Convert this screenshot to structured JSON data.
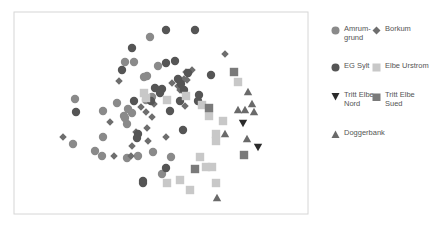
{
  "chart_data": {
    "type": "scatter",
    "title": "",
    "xlabel": "",
    "ylabel": "",
    "grid": false,
    "axes_ticks": false,
    "legend_position": "right",
    "frame": {
      "x0": 14,
      "y0": 12,
      "x1": 308,
      "y1": 214
    },
    "series": [
      {
        "name": "Amrum-grund",
        "marker": "circle",
        "color": "#8a8a8a",
        "points": [
          [
            150,
            37
          ],
          [
            125,
            62
          ],
          [
            134,
            62
          ],
          [
            158,
            66
          ],
          [
            147,
            76
          ],
          [
            144,
            77
          ],
          [
            75,
            99
          ],
          [
            117,
            103
          ],
          [
            103,
            111
          ],
          [
            128,
            109
          ],
          [
            124,
            116
          ],
          [
            132,
            113
          ],
          [
            125,
            118
          ],
          [
            127,
            124
          ],
          [
            146,
            100
          ],
          [
            152,
            97
          ],
          [
            103,
            137
          ],
          [
            73,
            144
          ],
          [
            95,
            151
          ],
          [
            102,
            156
          ],
          [
            153,
            152
          ],
          [
            171,
            157
          ],
          [
            162,
            174
          ],
          [
            127,
            158
          ],
          [
            138,
            156
          ]
        ]
      },
      {
        "name": "Borkum",
        "marker": "diamond",
        "color": "#6e6e6e",
        "points": [
          [
            225,
            54
          ],
          [
            119,
            81
          ],
          [
            192,
            70
          ],
          [
            187,
            80
          ],
          [
            172,
            83
          ],
          [
            180,
            90
          ],
          [
            110,
            122
          ],
          [
            141,
            107
          ],
          [
            146,
            112
          ],
          [
            152,
            117
          ],
          [
            154,
            104
          ],
          [
            147,
            128
          ],
          [
            136,
            132
          ],
          [
            148,
            141
          ],
          [
            166,
            137
          ],
          [
            63,
            137
          ],
          [
            114,
            156
          ],
          [
            132,
            146
          ],
          [
            131,
            156
          ],
          [
            185,
            106
          ],
          [
            186,
            72
          ],
          [
            178,
            86
          ],
          [
            184,
            79
          ]
        ]
      },
      {
        "name": "EG Sylt",
        "marker": "circle",
        "color": "#555555",
        "points": [
          [
            166,
            30
          ],
          [
            195,
            30
          ],
          [
            132,
            48
          ],
          [
            166,
            63
          ],
          [
            175,
            61
          ],
          [
            122,
            70
          ],
          [
            178,
            79
          ],
          [
            188,
            73
          ],
          [
            211,
            75
          ],
          [
            155,
            88
          ],
          [
            162,
            89
          ],
          [
            184,
            90
          ],
          [
            181,
            84
          ],
          [
            199,
            95
          ],
          [
            198,
            101
          ],
          [
            180,
            101
          ],
          [
            170,
            111
          ],
          [
            134,
            101
          ],
          [
            151,
            101
          ],
          [
            160,
            93
          ],
          [
            76,
            112
          ],
          [
            183,
            130
          ],
          [
            138,
            134
          ],
          [
            137,
            138
          ],
          [
            166,
            168
          ],
          [
            143,
            181
          ],
          [
            143,
            183
          ]
        ]
      },
      {
        "name": "Elbe Urstrom",
        "marker": "square",
        "color": "#c8c8c8",
        "points": [
          [
            238,
            82
          ],
          [
            144,
            93
          ],
          [
            167,
            100
          ],
          [
            186,
            96
          ],
          [
            202,
            105
          ],
          [
            209,
            116
          ],
          [
            223,
            121
          ],
          [
            216,
            134
          ],
          [
            216,
            141
          ],
          [
            200,
            157
          ],
          [
            206,
            167
          ],
          [
            212,
            167
          ],
          [
            216,
            183
          ],
          [
            180,
            180
          ],
          [
            167,
            183
          ],
          [
            190,
            190
          ],
          [
            146,
            98
          ]
        ]
      },
      {
        "name": "Tritt Elbe Nord",
        "marker": "triangle-down",
        "color": "#2b2b2b",
        "points": [
          [
            243,
            123
          ],
          [
            258,
            147
          ]
        ]
      },
      {
        "name": "Tritt Elbe Sued",
        "marker": "square",
        "color": "#7a7a7a",
        "points": [
          [
            234,
            72
          ],
          [
            209,
            108
          ],
          [
            195,
            169
          ],
          [
            244,
            155
          ]
        ]
      },
      {
        "name": "Doggerbank",
        "marker": "triangle-up",
        "color": "#6a6a6a",
        "points": [
          [
            248,
            92
          ],
          [
            238,
            110
          ],
          [
            245,
            110
          ],
          [
            252,
            104
          ],
          [
            254,
            112
          ],
          [
            225,
            134
          ],
          [
            247,
            139
          ],
          [
            217,
            198
          ]
        ]
      }
    ]
  },
  "legend": {
    "items": [
      {
        "label_line1": "Amrum-",
        "label_line2": "grund",
        "marker": "circle",
        "color": "#8a8a8a"
      },
      {
        "label_line1": "Borkum",
        "label_line2": "",
        "marker": "diamond",
        "color": "#6e6e6e"
      },
      {
        "label_line1": "EG Sylt",
        "label_line2": "",
        "marker": "circle",
        "color": "#555555"
      },
      {
        "label_line1": "Elbe Urstrom",
        "label_line2": "",
        "marker": "square",
        "color": "#c8c8c8"
      },
      {
        "label_line1": "Tritt Elbe",
        "label_line2": "Nord",
        "marker": "triangle-down",
        "color": "#2b2b2b"
      },
      {
        "label_line1": "Tritt Elbe",
        "label_line2": "Sued",
        "marker": "square",
        "color": "#7a7a7a"
      },
      {
        "label_line1": "Doggerbank",
        "label_line2": "",
        "marker": "triangle-up",
        "color": "#6a6a6a"
      }
    ]
  }
}
